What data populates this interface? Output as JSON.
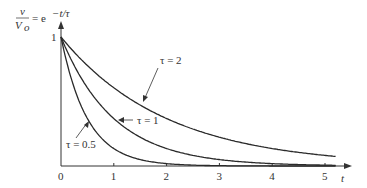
{
  "chart_data": {
    "type": "line",
    "ylabel_num": "v",
    "ylabel_den": "V",
    "ylabel_den_sub": "o",
    "ylabel_rhs": "= e",
    "ylabel_exp": "−t/τ",
    "xlabel": "t",
    "xticks": [
      "0",
      "1",
      "2",
      "3",
      "4",
      "5"
    ],
    "yticks": [
      "1"
    ],
    "xlim": [
      0,
      5.2
    ],
    "ylim": [
      0,
      1
    ],
    "grid": false,
    "series": [
      {
        "name": "τ = 2",
        "tau": 2,
        "label": "τ = 2"
      },
      {
        "name": "τ = 1",
        "tau": 1,
        "label": "τ = 1"
      },
      {
        "name": "τ = 0.5",
        "tau": 0.5,
        "label": "τ = 0.5"
      }
    ]
  }
}
